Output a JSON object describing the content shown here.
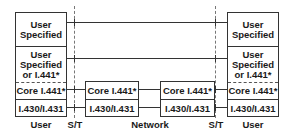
{
  "left_stack": {
    "layers": [
      "User Specified",
      "User Specified or I.441*",
      "Core I.441*",
      "I.430/I.431"
    ],
    "label": "User"
  },
  "right_stack": {
    "layers": [
      "User Specified",
      "User Specified or I.441*",
      "Core I.441*",
      "I.430/I.431"
    ],
    "label": "User"
  },
  "network_nodes": [
    {
      "layers": [
        "Core I.441*",
        "I.430/I.431"
      ]
    },
    {
      "layers": [
        "Core I.441*",
        "I.430/I.431"
      ]
    }
  ],
  "reference_points": {
    "left": "S/T",
    "right": "S/T"
  },
  "network_label": "Network"
}
